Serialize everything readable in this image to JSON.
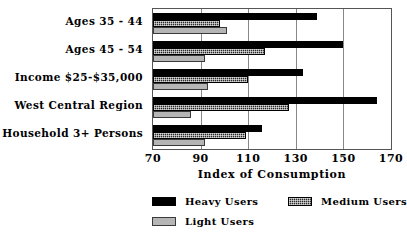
{
  "chart_data": {
    "type": "bar",
    "orientation": "horizontal",
    "title": "",
    "xlabel": "Index of Consumption",
    "ylabel": "",
    "xlim": [
      70,
      170
    ],
    "xticks": [
      70,
      90,
      110,
      130,
      150,
      170
    ],
    "grid": true,
    "legend_position": "bottom",
    "categories": [
      "Ages 35 - 44",
      "Ages 45 - 54",
      "Income $25-$35,000",
      "West Central Region",
      "Household 3+ Persons"
    ],
    "series": [
      {
        "name": "Heavy Users",
        "color": "#000000",
        "pattern": "solid",
        "values": [
          139,
          150,
          133,
          164,
          116
        ]
      },
      {
        "name": "Medium Users",
        "color": "#2b2b2b",
        "pattern": "checkered",
        "values": [
          98,
          117,
          110,
          127,
          109
        ]
      },
      {
        "name": "Light Users",
        "color": "#b5b5b5",
        "pattern": "light-gray",
        "values": [
          101,
          92,
          93,
          86,
          92
        ]
      }
    ]
  },
  "legend": {
    "entries": [
      {
        "label": "Heavy Users"
      },
      {
        "label": "Medium Users"
      },
      {
        "label": "Light Users"
      }
    ]
  }
}
